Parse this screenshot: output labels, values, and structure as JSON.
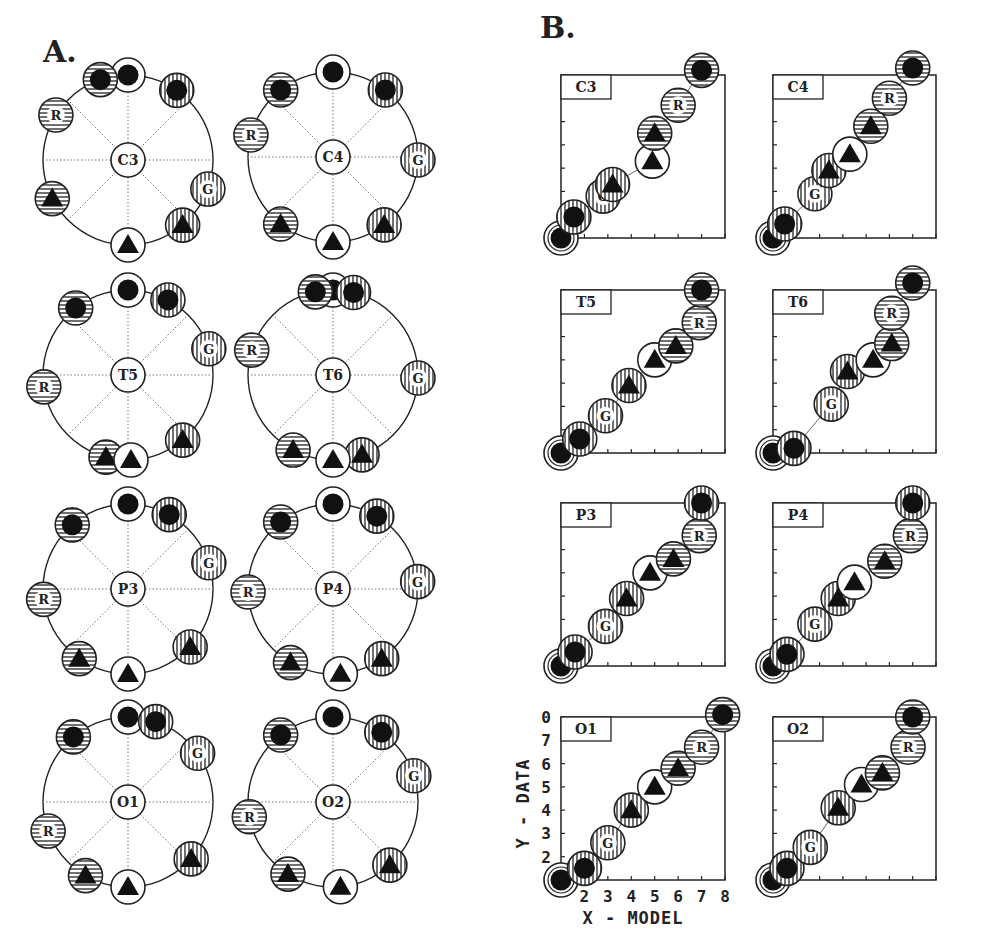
{
  "panels": {
    "A": {
      "letter": "A."
    },
    "B": {
      "letter": "B."
    }
  },
  "legend_markers": {
    "white_dot": {
      "fill": "white",
      "hatch": "none",
      "glyph": "dot"
    },
    "hstripe_dot": {
      "fill": "white",
      "hatch": "h",
      "glyph": "dot"
    },
    "vstripe_dot": {
      "fill": "white",
      "hatch": "v",
      "glyph": "dot"
    },
    "R": {
      "fill": "white",
      "hatch": "h",
      "glyph": "R"
    },
    "G": {
      "fill": "white",
      "hatch": "v",
      "glyph": "G"
    },
    "hstripe_tri": {
      "fill": "white",
      "hatch": "h",
      "glyph": "tri"
    },
    "white_tri": {
      "fill": "white",
      "hatch": "none",
      "glyph": "tri"
    },
    "vstripe_tri": {
      "fill": "white",
      "hatch": "v",
      "glyph": "tri"
    }
  },
  "chart_data": [
    {
      "type": "scatter",
      "title": "A. Circular configurations",
      "description": "Eight ring diagrams; each shows 8 stimulus markers arranged around a circle (angle in degrees, 0 = top, clockwise) with electrode label in the center.",
      "rings": [
        {
          "label": "C3",
          "cx": 128,
          "cy": 160,
          "r": 85,
          "markers": [
            {
              "id": "white_dot",
              "angle": 0
            },
            {
              "id": "hstripe_dot",
              "angle": -19
            },
            {
              "id": "vstripe_dot",
              "angle": 35
            },
            {
              "id": "R",
              "angle": -58
            },
            {
              "id": "hstripe_tri",
              "angle": -117
            },
            {
              "id": "G",
              "angle": 110
            },
            {
              "id": "vstripe_tri",
              "angle": 140
            },
            {
              "id": "white_tri",
              "angle": 180
            }
          ]
        },
        {
          "label": "C4",
          "cx": 333,
          "cy": 157,
          "r": 85,
          "markers": [
            {
              "id": "white_dot",
              "angle": 0
            },
            {
              "id": "hstripe_dot",
              "angle": -38
            },
            {
              "id": "vstripe_dot",
              "angle": 38
            },
            {
              "id": "R",
              "angle": -75
            },
            {
              "id": "hstripe_tri",
              "angle": -142
            },
            {
              "id": "G",
              "angle": 92
            },
            {
              "id": "vstripe_tri",
              "angle": 143
            },
            {
              "id": "white_tri",
              "angle": 180
            }
          ]
        },
        {
          "label": "T5",
          "cx": 128,
          "cy": 375,
          "r": 85,
          "markers": [
            {
              "id": "white_dot",
              "angle": 0
            },
            {
              "id": "hstripe_dot",
              "angle": -38
            },
            {
              "id": "vstripe_dot",
              "angle": 28
            },
            {
              "id": "R",
              "angle": -98
            },
            {
              "id": "hstripe_tri",
              "angle": -165
            },
            {
              "id": "G",
              "angle": 72
            },
            {
              "id": "vstripe_tri",
              "angle": 140
            },
            {
              "id": "white_tri",
              "angle": 178
            }
          ]
        },
        {
          "label": "T6",
          "cx": 333,
          "cy": 375,
          "r": 85,
          "markers": [
            {
              "id": "white_dot",
              "angle": 0
            },
            {
              "id": "hstripe_dot",
              "angle": -12
            },
            {
              "id": "vstripe_dot",
              "angle": 14
            },
            {
              "id": "R",
              "angle": -73
            },
            {
              "id": "hstripe_tri",
              "angle": -152
            },
            {
              "id": "G",
              "angle": 92
            },
            {
              "id": "vstripe_tri",
              "angle": 160
            },
            {
              "id": "white_tri",
              "angle": 180
            }
          ]
        },
        {
          "label": "P3",
          "cx": 128,
          "cy": 589,
          "r": 85,
          "markers": [
            {
              "id": "white_dot",
              "angle": 0
            },
            {
              "id": "hstripe_dot",
              "angle": -41
            },
            {
              "id": "vstripe_dot",
              "angle": 29
            },
            {
              "id": "R",
              "angle": -97
            },
            {
              "id": "hstripe_tri",
              "angle": -145
            },
            {
              "id": "G",
              "angle": 72
            },
            {
              "id": "vstripe_tri",
              "angle": 133
            },
            {
              "id": "white_tri",
              "angle": 180
            }
          ]
        },
        {
          "label": "P4",
          "cx": 333,
          "cy": 589,
          "r": 85,
          "markers": [
            {
              "id": "white_dot",
              "angle": 0
            },
            {
              "id": "hstripe_dot",
              "angle": -38
            },
            {
              "id": "vstripe_dot",
              "angle": 31
            },
            {
              "id": "R",
              "angle": -92
            },
            {
              "id": "hstripe_tri",
              "angle": -150
            },
            {
              "id": "G",
              "angle": 85
            },
            {
              "id": "vstripe_tri",
              "angle": 145
            },
            {
              "id": "white_tri",
              "angle": 175
            }
          ]
        },
        {
          "label": "O1",
          "cx": 128,
          "cy": 802,
          "r": 85,
          "markers": [
            {
              "id": "white_dot",
              "angle": 0
            },
            {
              "id": "hstripe_dot",
              "angle": -40
            },
            {
              "id": "vstripe_dot",
              "angle": 19
            },
            {
              "id": "R",
              "angle": -110
            },
            {
              "id": "hstripe_tri",
              "angle": -150
            },
            {
              "id": "G",
              "angle": 55
            },
            {
              "id": "vstripe_tri",
              "angle": 132
            },
            {
              "id": "white_tri",
              "angle": 180
            }
          ]
        },
        {
          "label": "O2",
          "cx": 333,
          "cy": 802,
          "r": 85,
          "markers": [
            {
              "id": "white_dot",
              "angle": 0
            },
            {
              "id": "hstripe_dot",
              "angle": -38
            },
            {
              "id": "vstripe_dot",
              "angle": 35
            },
            {
              "id": "R",
              "angle": -100
            },
            {
              "id": "hstripe_tri",
              "angle": -148
            },
            {
              "id": "G",
              "angle": 72
            },
            {
              "id": "vstripe_tri",
              "angle": 138
            },
            {
              "id": "white_tri",
              "angle": 175
            }
          ]
        }
      ]
    },
    {
      "type": "scatter",
      "title": "B. Data vs Model",
      "xlabel": "X - MODEL",
      "ylabel": "Y - DATA",
      "xlim": [
        1,
        8
      ],
      "ylim": [
        1,
        8
      ],
      "xticks": [
        2,
        3,
        4,
        5,
        6,
        7,
        8
      ],
      "yticks": [
        2,
        3,
        4,
        5,
        6,
        7,
        8
      ],
      "ytick_top_label": "0",
      "plots": [
        {
          "label": "C3",
          "x0": 561,
          "y0": 75,
          "w": 164,
          "h": 163,
          "points": [
            {
              "id": "white_dot",
              "x": 1.0,
              "y": 1.0
            },
            {
              "id": "vstripe_dot",
              "x": 1.55,
              "y": 1.9
            },
            {
              "id": "G",
              "x": 2.8,
              "y": 2.8
            },
            {
              "id": "vstripe_tri",
              "x": 3.2,
              "y": 3.3
            },
            {
              "id": "white_tri",
              "x": 4.9,
              "y": 4.3
            },
            {
              "id": "hstripe_tri",
              "x": 5.0,
              "y": 5.5
            },
            {
              "id": "R",
              "x": 6.0,
              "y": 6.7
            },
            {
              "id": "hstripe_dot",
              "x": 7.0,
              "y": 8.2
            }
          ]
        },
        {
          "label": "C4",
          "x0": 773,
          "y0": 75,
          "w": 163,
          "h": 163,
          "points": [
            {
              "id": "white_dot",
              "x": 1.0,
              "y": 1.0
            },
            {
              "id": "vstripe_dot",
              "x": 1.5,
              "y": 1.6
            },
            {
              "id": "G",
              "x": 2.8,
              "y": 2.9
            },
            {
              "id": "vstripe_tri",
              "x": 3.4,
              "y": 3.9
            },
            {
              "id": "white_tri",
              "x": 4.3,
              "y": 4.6
            },
            {
              "id": "hstripe_tri",
              "x": 5.2,
              "y": 5.8
            },
            {
              "id": "R",
              "x": 6.0,
              "y": 7.0
            },
            {
              "id": "hstripe_dot",
              "x": 7.0,
              "y": 8.3
            }
          ]
        },
        {
          "label": "T5",
          "x0": 561,
          "y0": 290,
          "w": 164,
          "h": 163,
          "points": [
            {
              "id": "white_dot",
              "x": 1.0,
              "y": 1.0
            },
            {
              "id": "vstripe_dot",
              "x": 1.8,
              "y": 1.6
            },
            {
              "id": "G",
              "x": 2.9,
              "y": 2.6
            },
            {
              "id": "vstripe_tri",
              "x": 3.9,
              "y": 3.9
            },
            {
              "id": "white_tri",
              "x": 5.0,
              "y": 5.0
            },
            {
              "id": "hstripe_tri",
              "x": 5.9,
              "y": 5.6
            },
            {
              "id": "R",
              "x": 6.9,
              "y": 6.6
            },
            {
              "id": "hstripe_dot",
              "x": 7.0,
              "y": 8.0
            }
          ]
        },
        {
          "label": "T6",
          "x0": 773,
          "y0": 290,
          "w": 163,
          "h": 163,
          "points": [
            {
              "id": "white_dot",
              "x": 1.0,
              "y": 1.0
            },
            {
              "id": "vstripe_dot",
              "x": 1.9,
              "y": 1.2
            },
            {
              "id": "G",
              "x": 3.5,
              "y": 3.1
            },
            {
              "id": "vstripe_tri",
              "x": 4.2,
              "y": 4.5
            },
            {
              "id": "white_tri",
              "x": 5.3,
              "y": 5.0
            },
            {
              "id": "hstripe_tri",
              "x": 6.1,
              "y": 5.7
            },
            {
              "id": "R",
              "x": 6.1,
              "y": 7.0
            },
            {
              "id": "hstripe_dot",
              "x": 7.0,
              "y": 8.3
            }
          ]
        },
        {
          "label": "P3",
          "x0": 561,
          "y0": 503,
          "w": 164,
          "h": 163,
          "points": [
            {
              "id": "white_dot",
              "x": 1.0,
              "y": 1.0
            },
            {
              "id": "vstripe_dot",
              "x": 1.6,
              "y": 1.6
            },
            {
              "id": "G",
              "x": 2.9,
              "y": 2.7
            },
            {
              "id": "vstripe_tri",
              "x": 3.8,
              "y": 3.9
            },
            {
              "id": "white_tri",
              "x": 4.8,
              "y": 5.0
            },
            {
              "id": "hstripe_tri",
              "x": 5.8,
              "y": 5.6
            },
            {
              "id": "R",
              "x": 6.9,
              "y": 6.6
            },
            {
              "id": "vstripe_dot",
              "x": 7.0,
              "y": 8.0
            }
          ]
        },
        {
          "label": "P4",
          "x0": 773,
          "y0": 503,
          "w": 163,
          "h": 163,
          "points": [
            {
              "id": "white_dot",
              "x": 1.0,
              "y": 1.0
            },
            {
              "id": "vstripe_dot",
              "x": 1.6,
              "y": 1.5
            },
            {
              "id": "G",
              "x": 2.8,
              "y": 2.8
            },
            {
              "id": "vstripe_tri",
              "x": 3.8,
              "y": 3.9
            },
            {
              "id": "white_tri",
              "x": 4.5,
              "y": 4.6
            },
            {
              "id": "hstripe_tri",
              "x": 5.8,
              "y": 5.5
            },
            {
              "id": "R",
              "x": 6.9,
              "y": 6.6
            },
            {
              "id": "vstripe_dot",
              "x": 7.0,
              "y": 8.0
            }
          ]
        },
        {
          "label": "O1",
          "x0": 561,
          "y0": 717,
          "w": 164,
          "h": 163,
          "points": [
            {
              "id": "white_dot",
              "x": 1.0,
              "y": 1.0
            },
            {
              "id": "vstripe_dot",
              "x": 2.0,
              "y": 1.5
            },
            {
              "id": "G",
              "x": 3.0,
              "y": 2.6
            },
            {
              "id": "vstripe_tri",
              "x": 4.0,
              "y": 4.0
            },
            {
              "id": "white_tri",
              "x": 5.0,
              "y": 5.0
            },
            {
              "id": "hstripe_tri",
              "x": 6.0,
              "y": 5.8
            },
            {
              "id": "R",
              "x": 7.0,
              "y": 6.7
            },
            {
              "id": "hstripe_dot",
              "x": 7.9,
              "y": 8.1
            }
          ]
        },
        {
          "label": "O2",
          "x0": 773,
          "y0": 717,
          "w": 163,
          "h": 163,
          "points": [
            {
              "id": "white_dot",
              "x": 1.0,
              "y": 1.0
            },
            {
              "id": "vstripe_dot",
              "x": 1.6,
              "y": 1.5
            },
            {
              "id": "G",
              "x": 2.6,
              "y": 2.4
            },
            {
              "id": "vstripe_tri",
              "x": 3.8,
              "y": 4.1
            },
            {
              "id": "white_tri",
              "x": 4.8,
              "y": 5.1
            },
            {
              "id": "hstripe_tri",
              "x": 5.7,
              "y": 5.6
            },
            {
              "id": "R",
              "x": 6.8,
              "y": 6.7
            },
            {
              "id": "hstripe_dot",
              "x": 7.0,
              "y": 8.0
            }
          ]
        }
      ]
    }
  ]
}
